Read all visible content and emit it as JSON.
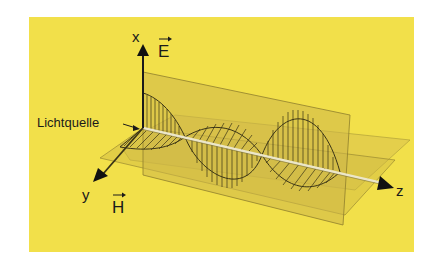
{
  "colors": {
    "background": "#f2e04a",
    "plane": "#d6bf47",
    "wave_stroke": "#3a3416",
    "axis": "#1a1a1a",
    "z_axis": "#e8e4c8"
  },
  "labels": {
    "x_axis": "x",
    "y_axis": "y",
    "z_axis": "z",
    "e_field": "E",
    "h_field": "H",
    "light_source": "Lichtquelle"
  },
  "icons": {
    "e_vector_arrow": "right-arrow",
    "h_vector_arrow": "right-arrow"
  }
}
